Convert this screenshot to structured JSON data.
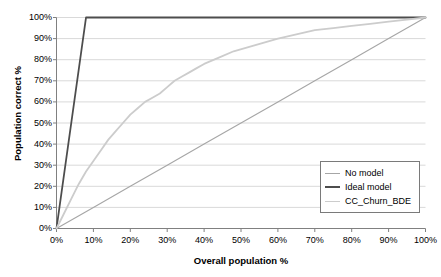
{
  "chart_data": {
    "type": "line",
    "title": "",
    "xlabel": "Overall population %",
    "ylabel": "Population correct %",
    "xlim": [
      0,
      100
    ],
    "ylim": [
      0,
      100
    ],
    "grid": true,
    "grid_axis": "y",
    "legend_position": "bottom-right",
    "x_ticks": [
      "0%",
      "10%",
      "20%",
      "30%",
      "40%",
      "50%",
      "60%",
      "70%",
      "80%",
      "90%",
      "100%"
    ],
    "x_tick_values": [
      0,
      10,
      20,
      30,
      40,
      50,
      60,
      70,
      80,
      90,
      100
    ],
    "y_ticks": [
      "0%",
      "10%",
      "20%",
      "30%",
      "40%",
      "50%",
      "60%",
      "70%",
      "80%",
      "90%",
      "100%"
    ],
    "y_tick_values": [
      0,
      10,
      20,
      30,
      40,
      50,
      60,
      70,
      80,
      90,
      100
    ],
    "series": [
      {
        "name": "No model",
        "color": "#a6a6a6",
        "width": 1.1,
        "x": [
          0,
          10,
          20,
          30,
          40,
          50,
          60,
          70,
          80,
          90,
          100
        ],
        "values": [
          0,
          10,
          20,
          30,
          40,
          50,
          60,
          70,
          80,
          90,
          100
        ]
      },
      {
        "name": "Ideal model",
        "color": "#4d4d4d",
        "width": 1.8,
        "x": [
          0,
          8,
          100
        ],
        "values": [
          0,
          100,
          100
        ]
      },
      {
        "name": "CC_Churn_BDE",
        "color": "#cccccc",
        "width": 1.8,
        "x": [
          0,
          2,
          4,
          6,
          8,
          10,
          12,
          14,
          16,
          18,
          20,
          22,
          24,
          26,
          28,
          30,
          32,
          34,
          36,
          38,
          40,
          44,
          48,
          52,
          56,
          60,
          65,
          70,
          75,
          80,
          85,
          90,
          95,
          100
        ],
        "values": [
          0,
          7,
          14,
          21,
          27,
          32,
          37,
          42,
          46,
          50,
          54,
          57,
          60,
          62,
          64,
          67,
          70,
          72,
          74,
          76,
          78,
          81,
          84,
          86,
          88,
          90,
          92,
          94,
          95,
          96,
          97,
          98,
          99,
          100
        ]
      }
    ]
  },
  "legend": {
    "items": [
      {
        "label": "No model",
        "color": "#a6a6a6"
      },
      {
        "label": "Ideal model",
        "color": "#4d4d4d"
      },
      {
        "label": "CC_Churn_BDE",
        "color": "#cccccc"
      }
    ]
  },
  "axes": {
    "x_title": "Overall population %",
    "y_title": "Population correct %",
    "axis_color": "#808080",
    "grid_color": "#d9d9d9"
  }
}
